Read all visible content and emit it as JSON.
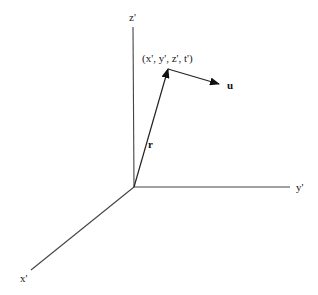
{
  "diagram": {
    "type": "3d-coordinate-frame",
    "colors": {
      "axis": "#444444",
      "vector": "#222222",
      "text": "#222222",
      "background": "#ffffff"
    },
    "origin": {
      "x": 134,
      "y": 187
    },
    "axes": [
      {
        "id": "z",
        "label": "z'",
        "end": {
          "x": 133,
          "y": 27
        },
        "label_pos": {
          "x": 129,
          "y": 21
        }
      },
      {
        "id": "y",
        "label": "y'",
        "end": {
          "x": 290,
          "y": 187
        },
        "label_pos": {
          "x": 296,
          "y": 191
        }
      },
      {
        "id": "x",
        "label": "x'",
        "end": {
          "x": 31,
          "y": 270
        },
        "label_pos": {
          "x": 20,
          "y": 282
        }
      }
    ],
    "vectors": [
      {
        "id": "r",
        "label": "r",
        "from": {
          "x": 134,
          "y": 187
        },
        "to": {
          "x": 168,
          "y": 69
        },
        "label_pos": {
          "x": 148,
          "y": 148
        }
      },
      {
        "id": "u",
        "label": "u",
        "from": {
          "x": 168,
          "y": 69
        },
        "to": {
          "x": 219,
          "y": 84
        },
        "label_pos": {
          "x": 227,
          "y": 89
        }
      }
    ],
    "point_label": {
      "text": "(x', y', z', t')",
      "pos": {
        "x": 142,
        "y": 62
      }
    }
  }
}
